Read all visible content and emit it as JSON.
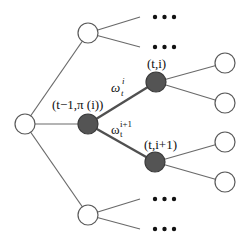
{
  "diagram": {
    "type": "tree",
    "labels": {
      "parent_node": "(t−1,π (i))",
      "child_node_1": "(t,i)",
      "child_node_2": "(t,i+1)",
      "edge_1_symbol": "ω",
      "edge_1_sup": "i",
      "edge_1_sub": "t",
      "edge_2_symbol": "ω",
      "edge_2_sup": "i+1",
      "edge_2_sub": "t"
    },
    "ellipsis": "•••",
    "colors": {
      "filled_node": "#545454",
      "open_node_stroke": "#5a5a5a",
      "edge": "#6a6a6a",
      "highlight_edge": "#505050"
    }
  }
}
